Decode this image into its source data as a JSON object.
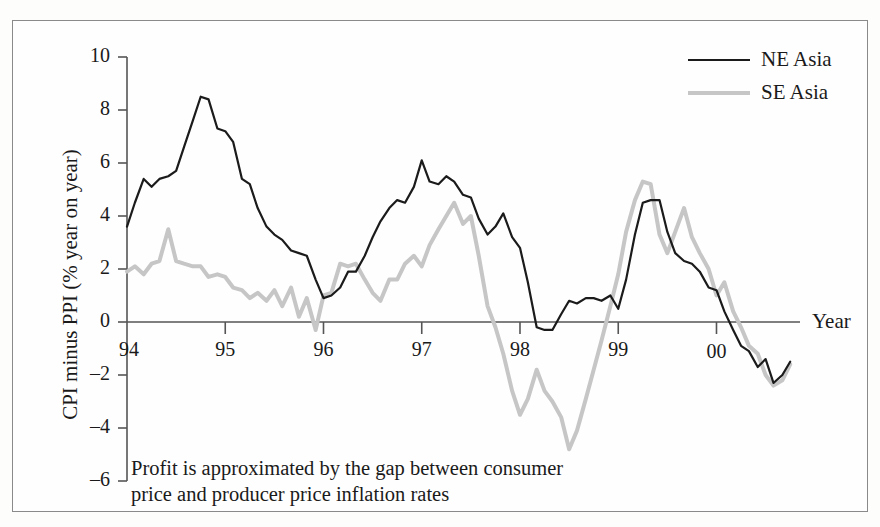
{
  "chart_data": {
    "type": "line",
    "title": "",
    "xlabel": "Year",
    "ylabel": "CPI minus PPI (% year on year)",
    "annotation": "Profit is approximated by the gap between consumer price and producer price inflation rates",
    "ylim": [
      -6,
      10
    ],
    "xlim": [
      1994.0,
      2000.85
    ],
    "yticks": [
      10,
      8,
      6,
      4,
      2,
      0,
      -2,
      -4,
      -6
    ],
    "ytick_labels": [
      "10",
      "8",
      "6",
      "4",
      "2",
      "0",
      "–2",
      "–4",
      "–6"
    ],
    "xticks": [
      1994,
      1995,
      1996,
      1997,
      1998,
      1999,
      2000
    ],
    "xtick_labels": [
      "94",
      "95",
      "96",
      "97",
      "98",
      "99",
      "00"
    ],
    "grid": false,
    "zero_line": true,
    "legend_position": "top-right",
    "colors": {
      "ne_asia": "#1b1b1b",
      "se_asia": "#c6c6c6",
      "axis": "#555555",
      "frame": "#8a8a8a",
      "text": "#1a1a1a"
    },
    "series": [
      {
        "name": "NE Asia",
        "color": "#1b1b1b",
        "x": [
          1994.0,
          1994.08,
          1994.17,
          1994.25,
          1994.33,
          1994.42,
          1994.5,
          1994.58,
          1994.67,
          1994.75,
          1994.83,
          1994.92,
          1995.0,
          1995.08,
          1995.17,
          1995.25,
          1995.33,
          1995.42,
          1995.5,
          1995.58,
          1995.67,
          1995.75,
          1995.83,
          1995.92,
          1996.0,
          1996.08,
          1996.17,
          1996.25,
          1996.33,
          1996.42,
          1996.5,
          1996.58,
          1996.67,
          1996.75,
          1996.83,
          1996.92,
          1997.0,
          1997.08,
          1997.17,
          1997.25,
          1997.33,
          1997.42,
          1997.5,
          1997.58,
          1997.67,
          1997.75,
          1997.83,
          1997.92,
          1998.0,
          1998.08,
          1998.17,
          1998.25,
          1998.33,
          1998.42,
          1998.5,
          1998.58,
          1998.67,
          1998.75,
          1998.83,
          1998.92,
          1999.0,
          1999.08,
          1999.17,
          1999.25,
          1999.33,
          1999.42,
          1999.5,
          1999.58,
          1999.67,
          1999.75,
          1999.83,
          1999.92,
          2000.0,
          2000.08,
          2000.17,
          2000.25,
          2000.33,
          2000.42,
          2000.5,
          2000.58,
          2000.67,
          2000.75
        ],
        "values": [
          3.6,
          4.5,
          5.4,
          5.1,
          5.4,
          5.5,
          5.7,
          6.6,
          7.6,
          8.5,
          8.4,
          7.3,
          7.2,
          6.8,
          5.4,
          5.2,
          4.3,
          3.6,
          3.3,
          3.1,
          2.7,
          2.6,
          2.5,
          1.6,
          0.9,
          1.0,
          1.3,
          1.9,
          1.9,
          2.5,
          3.2,
          3.8,
          4.3,
          4.6,
          4.5,
          5.1,
          6.1,
          5.3,
          5.2,
          5.5,
          5.3,
          4.8,
          4.7,
          3.9,
          3.3,
          3.6,
          4.1,
          3.2,
          2.8,
          1.5,
          -0.2,
          -0.3,
          -0.3,
          0.3,
          0.8,
          0.7,
          0.9,
          0.9,
          0.8,
          1.0,
          0.5,
          1.6,
          3.3,
          4.5,
          4.6,
          4.6,
          3.4,
          2.6,
          2.3,
          2.2,
          1.9,
          1.3,
          1.2,
          0.4,
          -0.3,
          -0.9,
          -1.1,
          -1.7,
          -1.4,
          -2.3,
          -2.0,
          -1.5
        ]
      },
      {
        "name": "SE Asia",
        "color": "#c6c6c6",
        "x": [
          1994.0,
          1994.08,
          1994.17,
          1994.25,
          1994.33,
          1994.42,
          1994.5,
          1994.58,
          1994.67,
          1994.75,
          1994.83,
          1994.92,
          1995.0,
          1995.08,
          1995.17,
          1995.25,
          1995.33,
          1995.42,
          1995.5,
          1995.58,
          1995.67,
          1995.75,
          1995.83,
          1995.92,
          1996.0,
          1996.08,
          1996.17,
          1996.25,
          1996.33,
          1996.42,
          1996.5,
          1996.58,
          1996.67,
          1996.75,
          1996.83,
          1996.92,
          1997.0,
          1997.08,
          1997.17,
          1997.25,
          1997.33,
          1997.42,
          1997.5,
          1997.58,
          1997.67,
          1997.75,
          1997.83,
          1997.92,
          1998.0,
          1998.08,
          1998.17,
          1998.25,
          1998.33,
          1998.42,
          1998.5,
          1998.58,
          1998.67,
          1998.75,
          1998.83,
          1998.92,
          1999.0,
          1999.08,
          1999.17,
          1999.25,
          1999.33,
          1999.42,
          1999.5,
          1999.58,
          1999.67,
          1999.75,
          1999.83,
          1999.92,
          2000.0,
          2000.08,
          2000.17,
          2000.25,
          2000.33,
          2000.42,
          2000.5,
          2000.58,
          2000.67,
          2000.75
        ],
        "values": [
          1.9,
          2.1,
          1.8,
          2.2,
          2.3,
          3.5,
          2.3,
          2.2,
          2.1,
          2.1,
          1.7,
          1.8,
          1.7,
          1.3,
          1.2,
          0.9,
          1.1,
          0.8,
          1.2,
          0.6,
          1.3,
          0.2,
          0.9,
          -0.3,
          1.0,
          1.1,
          2.2,
          2.1,
          2.2,
          1.6,
          1.1,
          0.8,
          1.6,
          1.6,
          2.2,
          2.5,
          2.1,
          2.9,
          3.5,
          4.0,
          4.5,
          3.7,
          4.0,
          2.5,
          0.6,
          -0.2,
          -1.2,
          -2.6,
          -3.5,
          -2.9,
          -1.8,
          -2.6,
          -3.0,
          -3.6,
          -4.8,
          -4.1,
          -2.9,
          -1.8,
          -0.7,
          0.6,
          1.8,
          3.4,
          4.6,
          5.3,
          5.2,
          3.3,
          2.6,
          3.4,
          4.3,
          3.2,
          2.6,
          2.0,
          1.0,
          1.5,
          0.4,
          -0.2,
          -0.9,
          -1.2,
          -2.0,
          -2.4,
          -2.2,
          -1.6
        ]
      }
    ]
  },
  "axis": {
    "year_label": "Year",
    "ylabel": "CPI minus PPI (% year on year)"
  },
  "legend": {
    "items": [
      {
        "label": "NE Asia",
        "style": "solid-dark"
      },
      {
        "label": "SE Asia",
        "style": "solid-light"
      }
    ]
  },
  "caption": {
    "line1": "Profit is approximated by the gap between consumer",
    "line2": "price and producer price inflation rates"
  }
}
